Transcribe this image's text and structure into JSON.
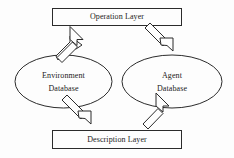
{
  "diagram": {
    "background_color": "#fdfdfd",
    "line_color": "#2b2b2b",
    "text_color": "#1a1a1a",
    "nodes": [
      {
        "id": "operation-layer",
        "shape": "rectangle",
        "label": "Operation Layer"
      },
      {
        "id": "environment-database",
        "shape": "ellipse",
        "label_line1": "Environment",
        "label_line2": "Database"
      },
      {
        "id": "agent-database",
        "shape": "ellipse",
        "label_line1": "Agent",
        "label_line2": "Database"
      },
      {
        "id": "description-layer",
        "shape": "rectangle",
        "label": "Description Layer"
      }
    ],
    "edges": [
      {
        "id": "env-to-operation",
        "from": "environment-database",
        "to": "operation-layer",
        "style": "hollow-block-arrow"
      },
      {
        "id": "operation-to-agent",
        "from": "operation-layer",
        "to": "agent-database",
        "style": "hollow-block-arrow"
      },
      {
        "id": "env-to-description",
        "from": "environment-database",
        "to": "description-layer",
        "style": "hollow-block-arrow"
      },
      {
        "id": "description-to-agent",
        "from": "description-layer",
        "to": "agent-database",
        "style": "hollow-block-arrow"
      }
    ]
  }
}
